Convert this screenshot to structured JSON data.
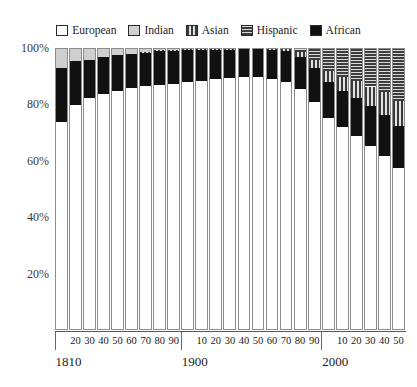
{
  "chart_data": {
    "type": "bar",
    "subtype": "stacked-percent",
    "title": "",
    "xlabel": "",
    "ylabel": "",
    "ylim": [
      0,
      100
    ],
    "yticks": [
      "20%",
      "40%",
      "60%",
      "80%",
      "100%"
    ],
    "ytick_values": [
      20,
      40,
      60,
      80,
      100
    ],
    "grid": false,
    "legend_position": "top-center",
    "legend": [
      "European",
      "Indian",
      "Asian",
      "Hispanic",
      "African"
    ],
    "colors": {
      "European": "#ffffff",
      "Indian": "#cfcfcf",
      "Asian": "#3a3a3a",
      "Hispanic": "#3c3c3c",
      "African": "#111111"
    },
    "patterns": {
      "European": "solid-white",
      "Indian": "solid-light-gray",
      "Asian": "vertical-stripes",
      "Hispanic": "horizontal-stripes",
      "African": "solid-black"
    },
    "categories": [
      "1810",
      "20",
      "30",
      "40",
      "50",
      "60",
      "70",
      "80",
      "90",
      "1900",
      "10",
      "20",
      "30",
      "40",
      "50",
      "60",
      "70",
      "80",
      "90",
      "2000",
      "10",
      "20",
      "30",
      "40",
      "50"
    ],
    "century_labels": [
      "1810",
      "1900",
      "2000"
    ],
    "decade_labels_group1": [
      "20",
      "30",
      "40",
      "50",
      "60",
      "70",
      "80",
      "90"
    ],
    "decade_labels_group2": [
      "10",
      "20",
      "30",
      "40",
      "50",
      "60",
      "70",
      "80",
      "90"
    ],
    "decade_labels_group3": [
      "10",
      "20",
      "30",
      "40",
      "50"
    ],
    "series": [
      {
        "name": "European",
        "values": [
          73.5,
          79.5,
          82.0,
          83.5,
          84.5,
          85.5,
          86.0,
          86.5,
          87.0,
          87.5,
          88.0,
          88.5,
          89.0,
          89.5,
          89.5,
          88.5,
          87.5,
          85.0,
          80.5,
          75.0,
          71.5,
          68.5,
          65.0,
          61.5,
          57.0
        ]
      },
      {
        "name": "African",
        "values": [
          19.0,
          15.5,
          13.5,
          13.0,
          12.5,
          12.0,
          12.0,
          12.0,
          11.5,
          11.5,
          11.0,
          10.5,
          10.0,
          10.0,
          10.0,
          10.5,
          11.0,
          11.5,
          12.0,
          12.5,
          13.0,
          13.5,
          14.0,
          14.5,
          15.0
        ]
      },
      {
        "name": "Asian",
        "values": [
          0.0,
          0.0,
          0.0,
          0.0,
          0.0,
          0.0,
          0.3,
          0.3,
          0.3,
          0.3,
          0.3,
          0.3,
          0.3,
          0.3,
          0.5,
          0.8,
          1.2,
          1.8,
          3.0,
          4.0,
          5.0,
          6.0,
          7.0,
          8.0,
          9.0
        ]
      },
      {
        "name": "Hispanic",
        "values": [
          0.0,
          0.0,
          0.0,
          0.0,
          0.0,
          0.0,
          0.0,
          0.0,
          0.0,
          0.0,
          0.0,
          0.0,
          0.0,
          0.0,
          0.0,
          0.2,
          0.3,
          1.7,
          4.5,
          8.5,
          10.5,
          12.0,
          14.0,
          16.0,
          19.0
        ]
      },
      {
        "name": "Indian",
        "values": [
          7.5,
          5.0,
          4.5,
          3.5,
          3.0,
          2.5,
          1.7,
          1.2,
          1.2,
          0.7,
          0.7,
          0.7,
          0.7,
          0.2,
          0.0,
          0.0,
          0.0,
          0.0,
          0.0,
          0.0,
          0.0,
          0.0,
          0.0,
          0.0,
          0.0
        ]
      }
    ],
    "stack_order_bottom_to_top": [
      "European",
      "African",
      "Asian",
      "Hispanic",
      "Indian"
    ]
  }
}
